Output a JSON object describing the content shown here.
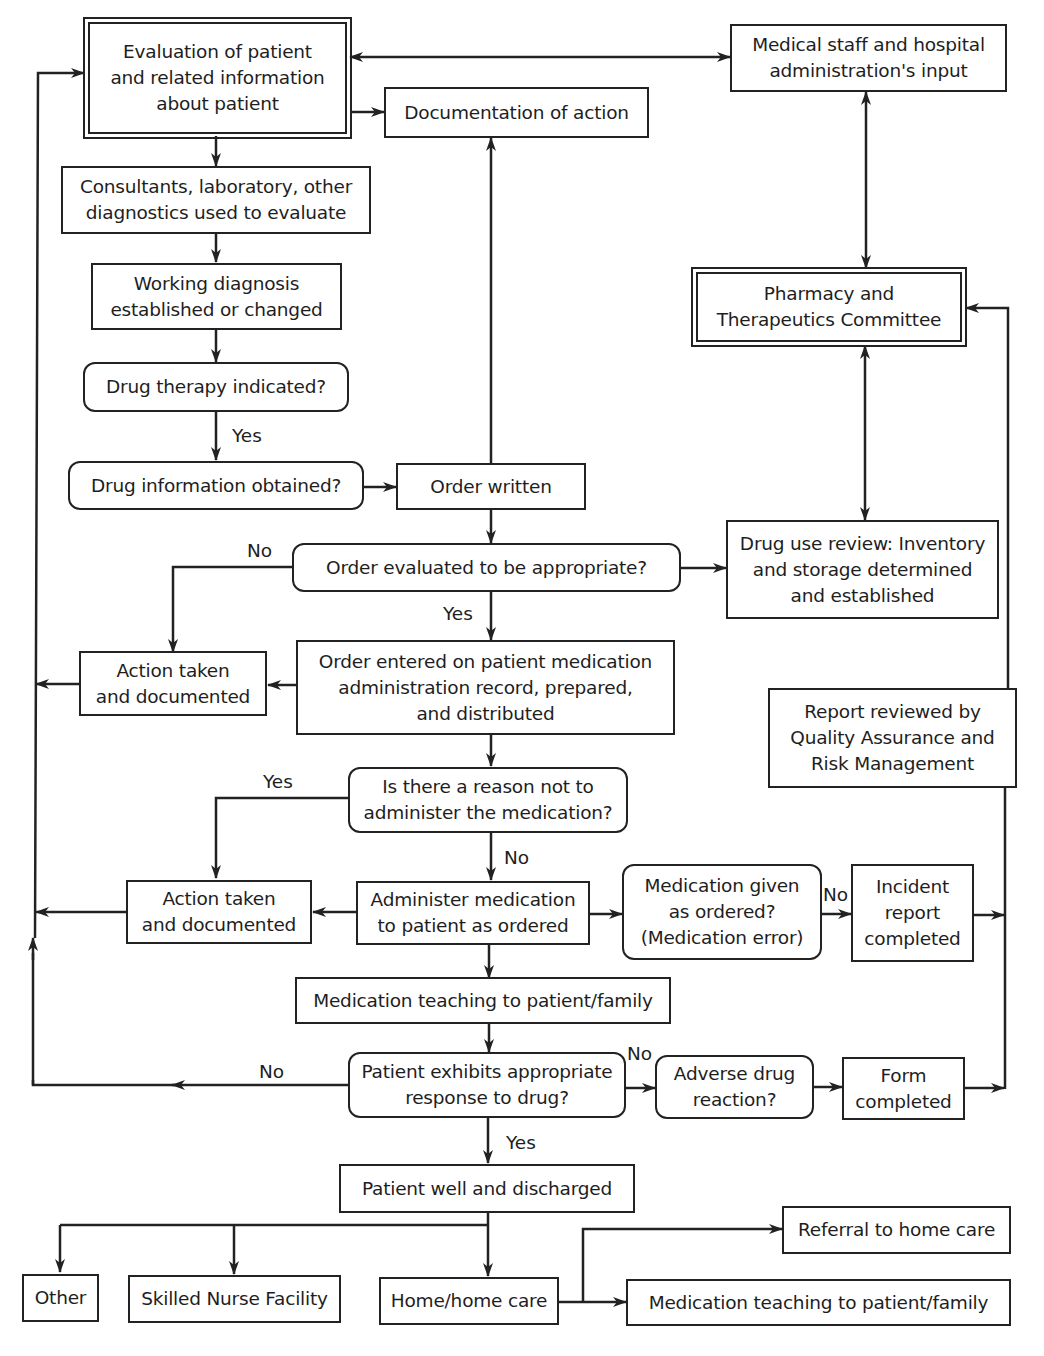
{
  "diagram": {
    "type": "flowchart",
    "nodes": [
      {
        "id": "eval",
        "text": "Evaluation of patient\nand related information\nabout patient",
        "shape": "double-rect"
      },
      {
        "id": "doc",
        "text": "Documentation of action",
        "shape": "rect"
      },
      {
        "id": "staff",
        "text": "Medical staff and hospital\nadministration's input",
        "shape": "rect"
      },
      {
        "id": "consult",
        "text": "Consultants, laboratory, other\ndiagnostics used to evaluate",
        "shape": "rect"
      },
      {
        "id": "workdx",
        "text": "Working diagnosis\nestablished or changed",
        "shape": "rect"
      },
      {
        "id": "therapy",
        "text": "Drug therapy indicated?",
        "shape": "rounded"
      },
      {
        "id": "druginfo",
        "text": "Drug information obtained?",
        "shape": "rounded"
      },
      {
        "id": "order",
        "text": "Order written",
        "shape": "rect"
      },
      {
        "id": "ptc",
        "text": "Pharmacy and\nTherapeutics Committee",
        "shape": "double-rect"
      },
      {
        "id": "ordereval",
        "text": "Order evaluated to be appropriate?",
        "shape": "rounded"
      },
      {
        "id": "dur",
        "text": "Drug use review: Inventory\nand storage determined\nand established",
        "shape": "rect"
      },
      {
        "id": "action1",
        "text": "Action taken\nand documented",
        "shape": "rect"
      },
      {
        "id": "entered",
        "text": "Order entered on patient medication\nadministration record, prepared,\nand distributed",
        "shape": "rect"
      },
      {
        "id": "qa",
        "text": "Report reviewed by\nQuality Assurance and\nRisk Management",
        "shape": "rect"
      },
      {
        "id": "reason",
        "text": "Is there a reason not to\nadminister the medication?",
        "shape": "rounded"
      },
      {
        "id": "action2",
        "text": "Action taken\nand documented",
        "shape": "rect"
      },
      {
        "id": "administer",
        "text": "Administer medication\nto patient as ordered",
        "shape": "rect"
      },
      {
        "id": "given",
        "text": "Medication given\nas ordered?\n(Medication error)",
        "shape": "rounded"
      },
      {
        "id": "incident",
        "text": "Incident\nreport\ncompleted",
        "shape": "rect"
      },
      {
        "id": "teach1",
        "text": "Medication teaching to patient/family",
        "shape": "rect"
      },
      {
        "id": "response",
        "text": "Patient exhibits appropriate\nresponse to drug?",
        "shape": "rounded"
      },
      {
        "id": "adverse",
        "text": "Adverse drug\nreaction?",
        "shape": "rounded"
      },
      {
        "id": "form",
        "text": "Form\ncompleted",
        "shape": "rect"
      },
      {
        "id": "discharged",
        "text": "Patient well and discharged",
        "shape": "rect"
      },
      {
        "id": "other",
        "text": "Other",
        "shape": "rect"
      },
      {
        "id": "snf",
        "text": "Skilled Nurse Facility",
        "shape": "rect"
      },
      {
        "id": "home",
        "text": "Home/home care",
        "shape": "rect"
      },
      {
        "id": "referral",
        "text": "Referral to home care",
        "shape": "rect"
      },
      {
        "id": "teach2",
        "text": "Medication teaching to patient/family",
        "shape": "rect"
      }
    ],
    "edge_labels": {
      "therapy_yes": "Yes",
      "ordereval_no": "No",
      "ordereval_yes": "Yes",
      "reason_yes": "Yes",
      "reason_no": "No",
      "given_no": "No",
      "response_no_left": "No",
      "response_no_right": "No",
      "response_yes": "Yes"
    },
    "edges": [
      {
        "from": "eval",
        "to": "staff",
        "bidirectional": true
      },
      {
        "from": "eval",
        "to": "doc"
      },
      {
        "from": "eval",
        "to": "consult"
      },
      {
        "from": "consult",
        "to": "workdx"
      },
      {
        "from": "workdx",
        "to": "therapy"
      },
      {
        "from": "therapy",
        "to": "druginfo",
        "label": "Yes"
      },
      {
        "from": "druginfo",
        "to": "order"
      },
      {
        "from": "order",
        "to": "doc"
      },
      {
        "from": "order",
        "to": "ordereval"
      },
      {
        "from": "staff",
        "to": "ptc",
        "bidirectional": true
      },
      {
        "from": "ptc",
        "to": "dur",
        "bidirectional": true
      },
      {
        "from": "ordereval",
        "to": "dur"
      },
      {
        "from": "ordereval",
        "to": "action1",
        "label": "No"
      },
      {
        "from": "ordereval",
        "to": "entered",
        "label": "Yes"
      },
      {
        "from": "entered",
        "to": "action1"
      },
      {
        "from": "action1",
        "to": "eval"
      },
      {
        "from": "entered",
        "to": "reason"
      },
      {
        "from": "reason",
        "to": "action2",
        "label": "Yes"
      },
      {
        "from": "reason",
        "to": "administer",
        "label": "No"
      },
      {
        "from": "administer",
        "to": "action2"
      },
      {
        "from": "action2",
        "to": "eval"
      },
      {
        "from": "administer",
        "to": "given"
      },
      {
        "from": "given",
        "to": "incident",
        "label": "No"
      },
      {
        "from": "incident",
        "to": "qa"
      },
      {
        "from": "qa",
        "to": "ptc"
      },
      {
        "from": "administer",
        "to": "teach1"
      },
      {
        "from": "teach1",
        "to": "response"
      },
      {
        "from": "response",
        "to": "eval",
        "label": "No"
      },
      {
        "from": "response",
        "to": "adverse",
        "label": "No"
      },
      {
        "from": "adverse",
        "to": "form"
      },
      {
        "from": "form",
        "to": "qa"
      },
      {
        "from": "response",
        "to": "discharged",
        "label": "Yes"
      },
      {
        "from": "discharged",
        "to": "other"
      },
      {
        "from": "discharged",
        "to": "snf"
      },
      {
        "from": "discharged",
        "to": "home"
      },
      {
        "from": "home",
        "to": "referral"
      },
      {
        "from": "home",
        "to": "teach2"
      }
    ]
  }
}
